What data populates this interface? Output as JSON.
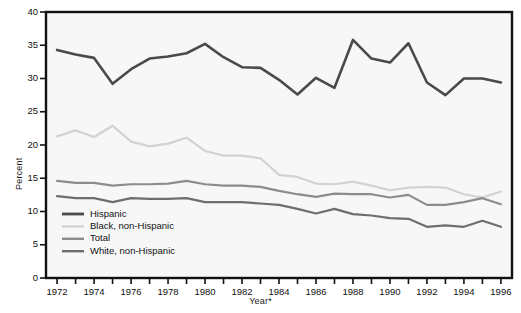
{
  "chart_data": {
    "type": "line",
    "title": "",
    "xlabel": "Year*",
    "ylabel": "Percent",
    "xlim": [
      1971.4,
      1996.6
    ],
    "ylim": [
      0,
      40
    ],
    "yticks": [
      0,
      5,
      10,
      15,
      20,
      25,
      30,
      35,
      40
    ],
    "ytick_labels": [
      "0",
      "5",
      "10",
      "15",
      "20",
      "25",
      "30",
      "35",
      "40"
    ],
    "xticks": [
      1972,
      1973,
      1974,
      1975,
      1976,
      1977,
      1978,
      1979,
      1980,
      1981,
      1982,
      1983,
      1984,
      1985,
      1986,
      1987,
      1988,
      1989,
      1990,
      1991,
      1992,
      1993,
      1994,
      1995,
      1996
    ],
    "xtick_labels_major": [
      "1972",
      "1974",
      "1976",
      "1978",
      "1980",
      "1982",
      "1984",
      "1986",
      "1988",
      "1990",
      "1992",
      "1994",
      "1996"
    ],
    "grid": false,
    "legend_position": "lower-left-inside",
    "x": [
      1972,
      1973,
      1974,
      1975,
      1976,
      1977,
      1978,
      1979,
      1980,
      1981,
      1982,
      1983,
      1984,
      1985,
      1986,
      1987,
      1988,
      1989,
      1990,
      1991,
      1992,
      1993,
      1994,
      1995,
      1996
    ],
    "series": [
      {
        "name": "Hispanic",
        "color": "#4a4a4a",
        "values": [
          34.3,
          33.6,
          33.1,
          29.2,
          31.4,
          33.0,
          33.3,
          33.8,
          35.2,
          33.2,
          31.7,
          31.6,
          29.8,
          27.6,
          30.1,
          28.6,
          35.8,
          33.0,
          32.4,
          35.3,
          29.4,
          27.5,
          30.0,
          30.0,
          29.4
        ],
        "linewidth": 2.6
      },
      {
        "name": "Black, non-Hispanic",
        "color": "#d2d2d2",
        "values": [
          21.3,
          22.2,
          21.2,
          22.9,
          20.5,
          19.8,
          20.2,
          21.1,
          19.1,
          18.4,
          18.4,
          18.0,
          15.5,
          15.2,
          14.2,
          14.1,
          14.5,
          13.9,
          13.2,
          13.6,
          13.7,
          13.6,
          12.6,
          12.1,
          13.0
        ],
        "linewidth": 2.2
      },
      {
        "name": "Total",
        "color": "#8c8c8c",
        "values": [
          14.6,
          14.3,
          14.3,
          13.9,
          14.1,
          14.1,
          14.2,
          14.6,
          14.1,
          13.9,
          13.9,
          13.7,
          13.1,
          12.6,
          12.2,
          12.7,
          12.6,
          12.6,
          12.1,
          12.5,
          11.0,
          11.0,
          11.4,
          12.0,
          11.1
        ],
        "linewidth": 2.2
      },
      {
        "name": "White, non-Hispanic",
        "color": "#6e6e6e",
        "values": [
          12.3,
          12.0,
          12.0,
          11.4,
          12.0,
          11.9,
          11.9,
          12.0,
          11.4,
          11.4,
          11.4,
          11.2,
          11.0,
          10.4,
          9.7,
          10.4,
          9.6,
          9.4,
          9.0,
          8.9,
          7.7,
          7.9,
          7.7,
          8.6,
          7.7
        ],
        "linewidth": 2.2
      }
    ],
    "legend": [
      {
        "label": "Hispanic",
        "color": "#4a4a4a"
      },
      {
        "label": "Black, non-Hispanic",
        "color": "#d2d2d2"
      },
      {
        "label": "Total",
        "color": "#8c8c8c"
      },
      {
        "label": "White, non-Hispanic",
        "color": "#6e6e6e"
      }
    ],
    "plot_background": "#f7f7f7",
    "axis_color": "#111111"
  }
}
